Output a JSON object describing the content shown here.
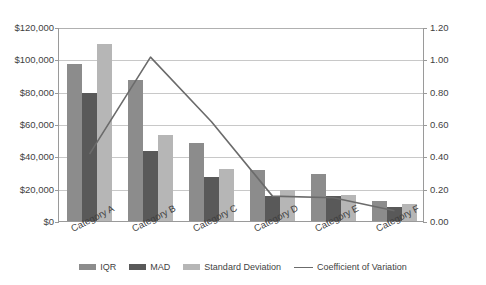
{
  "chart_data": {
    "type": "bar",
    "title": "",
    "subtitle": "",
    "xlabel": "",
    "ylabel": "",
    "categories": [
      "Category A",
      "Category B",
      "Category C",
      "Category D",
      "Category E",
      "Category F"
    ],
    "series": [
      {
        "name": "IQR",
        "type": "bar",
        "axis": "left",
        "color": "#8c8c8c",
        "values": [
          98000,
          88000,
          49000,
          32000,
          30000,
          13000
        ]
      },
      {
        "name": "MAD",
        "type": "bar",
        "axis": "left",
        "color": "#595959",
        "values": [
          80000,
          44000,
          28000,
          16000,
          16000,
          9000
        ]
      },
      {
        "name": "Standard Deviation",
        "type": "bar",
        "axis": "left",
        "color": "#b6b6b6",
        "values": [
          110000,
          54000,
          33000,
          20000,
          17000,
          11000
        ]
      },
      {
        "name": "Coefficient of Variation",
        "type": "line",
        "axis": "right",
        "color": "#6b6b6b",
        "values": [
          0.42,
          1.02,
          0.62,
          0.16,
          0.15,
          0.07
        ]
      }
    ],
    "y_left": {
      "min": 0,
      "max": 120000,
      "step": 20000,
      "ticks": [
        "$0",
        "$20,000",
        "$40,000",
        "$60,000",
        "$80,000",
        "$100,000",
        "$120,000"
      ]
    },
    "y_right": {
      "min": 0,
      "max": 1.2,
      "step": 0.2,
      "ticks": [
        "0.00",
        "0.20",
        "0.40",
        "0.60",
        "0.80",
        "1.00",
        "1.20"
      ]
    },
    "grid": true,
    "legend_position": "bottom"
  },
  "legend": {
    "items": [
      {
        "label": "IQR",
        "marker": "swatch"
      },
      {
        "label": "MAD",
        "marker": "swatch"
      },
      {
        "label": "Standard Deviation",
        "marker": "swatch"
      },
      {
        "label": "Coefficient of Variation",
        "marker": "line"
      }
    ]
  }
}
